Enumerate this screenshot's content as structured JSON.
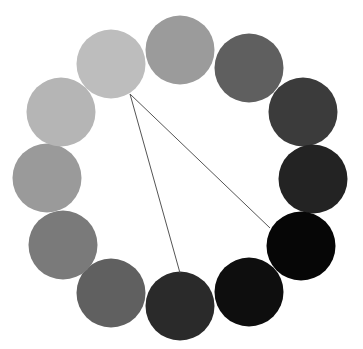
{
  "diagram": {
    "type": "grayscale-circle-wheel",
    "width": 363,
    "height": 349,
    "radius": 34.5,
    "circles": [
      {
        "id": "c1",
        "cx": 111,
        "cy": 64,
        "color": "#bdbdbd"
      },
      {
        "id": "c2",
        "cx": 180,
        "cy": 50,
        "color": "#9b9b9b"
      },
      {
        "id": "c3",
        "cx": 249,
        "cy": 68,
        "color": "#5f5f5f"
      },
      {
        "id": "c4",
        "cx": 303,
        "cy": 112,
        "color": "#3b3b3b"
      },
      {
        "id": "c5",
        "cx": 313,
        "cy": 179,
        "color": "#232323"
      },
      {
        "id": "c6",
        "cx": 301,
        "cy": 246,
        "color": "#060606"
      },
      {
        "id": "c7",
        "cx": 249,
        "cy": 292,
        "color": "#0e0e0e"
      },
      {
        "id": "c8",
        "cx": 180,
        "cy": 306,
        "color": "#2a2a2a"
      },
      {
        "id": "c9",
        "cx": 111,
        "cy": 293,
        "color": "#606060"
      },
      {
        "id": "c10",
        "cx": 63,
        "cy": 245,
        "color": "#7a7a7a"
      },
      {
        "id": "c11",
        "cx": 47,
        "cy": 178,
        "color": "#9a9a9a"
      },
      {
        "id": "c12",
        "cx": 61,
        "cy": 112,
        "color": "#b5b5b5"
      }
    ],
    "lines": [
      {
        "id": "l1",
        "x1": 130,
        "y1": 94,
        "x2": 180,
        "y2": 273,
        "color": "#555555",
        "width": 1
      },
      {
        "id": "l2",
        "x1": 130,
        "y1": 94,
        "x2": 270,
        "y2": 228,
        "color": "#555555",
        "width": 1
      }
    ]
  }
}
